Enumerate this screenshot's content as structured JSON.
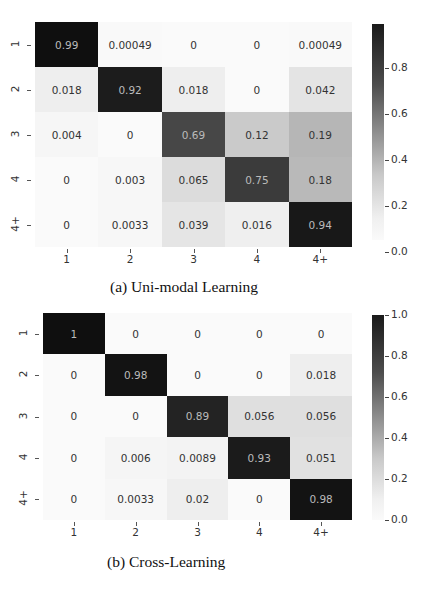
{
  "chart_data": [
    {
      "type": "heatmap",
      "title": "(a) Uni-modal Learning",
      "row_labels": [
        "1",
        "2",
        "3",
        "4",
        "4+"
      ],
      "col_labels": [
        "1",
        "2",
        "3",
        "4",
        "4+"
      ],
      "values": [
        [
          0.99,
          0.00049,
          0,
          0,
          0.00049
        ],
        [
          0.018,
          0.92,
          0.018,
          0,
          0.042
        ],
        [
          0.004,
          0,
          0.69,
          0.12,
          0.19
        ],
        [
          0,
          0.003,
          0.065,
          0.75,
          0.18
        ],
        [
          0,
          0.0033,
          0.039,
          0.016,
          0.94
        ]
      ],
      "cell_text": [
        [
          "0.99",
          "0.00049",
          "0",
          "0",
          "0.00049"
        ],
        [
          "0.018",
          "0.92",
          "0.018",
          "0",
          "0.042"
        ],
        [
          "0.004",
          "0",
          "0.69",
          "0.12",
          "0.19"
        ],
        [
          "0",
          "0.003",
          "0.065",
          "0.75",
          "0.18"
        ],
        [
          "0",
          "0.0033",
          "0.039",
          "0.016",
          "0.94"
        ]
      ],
      "colorbar": {
        "min": 0.0,
        "max": 0.99,
        "ticks": [
          "0.0",
          "0.2",
          "0.4",
          "0.6",
          "0.8"
        ],
        "colormap": "Greys"
      },
      "xlabel": "",
      "ylabel": "",
      "grid": false
    },
    {
      "type": "heatmap",
      "title": "(b) Cross-Learning",
      "row_labels": [
        "1",
        "2",
        "3",
        "4",
        "4+"
      ],
      "col_labels": [
        "1",
        "2",
        "3",
        "4",
        "4+"
      ],
      "values": [
        [
          1,
          0,
          0,
          0,
          0
        ],
        [
          0,
          0.98,
          0,
          0,
          0.018
        ],
        [
          0,
          0,
          0.89,
          0.056,
          0.056
        ],
        [
          0,
          0.006,
          0.0089,
          0.93,
          0.051
        ],
        [
          0,
          0.0033,
          0.02,
          0,
          0.98
        ]
      ],
      "cell_text": [
        [
          "1",
          "0",
          "0",
          "0",
          "0"
        ],
        [
          "0",
          "0.98",
          "0",
          "0",
          "0.018"
        ],
        [
          "0",
          "0",
          "0.89",
          "0.056",
          "0.056"
        ],
        [
          "0",
          "0.006",
          "0.0089",
          "0.93",
          "0.051"
        ],
        [
          "0",
          "0.0033",
          "0.02",
          "0",
          "0.98"
        ]
      ],
      "colorbar": {
        "min": 0.0,
        "max": 1.0,
        "ticks": [
          "0.0",
          "0.2",
          "0.4",
          "0.6",
          "0.8",
          "1.0"
        ],
        "colormap": "Greys"
      },
      "xlabel": "",
      "ylabel": "",
      "grid": false
    }
  ],
  "captions": {
    "a": "(a) Uni-modal Learning",
    "b": "(b) Cross-Learning"
  }
}
